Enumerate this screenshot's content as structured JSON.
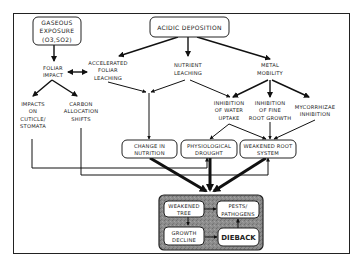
{
  "diagram": {
    "nodes": {
      "gaseous": [
        "GASEOUS",
        "EXPOSURE",
        "(O3,SO2)"
      ],
      "acidic": [
        "ACIDIC DEPOSITION"
      ],
      "foliar_impact": [
        "FOLIAR",
        "IMPACT"
      ],
      "accel_leaching": [
        "ACCELERATED",
        "FOLIAR",
        "LEACHING"
      ],
      "nutrient_leaching": [
        "NUTRIENT",
        "LEACHING"
      ],
      "metal_mobility": [
        "METAL",
        "MOBILITY"
      ],
      "impacts_cuticle": [
        "IMPACTS",
        "ON",
        "CUTICLE/",
        "STOMATA"
      ],
      "carbon_alloc": [
        "CARBON",
        "ALLOCATION",
        "SHIFTS"
      ],
      "inhib_water": [
        "INHIBITION",
        "OF WATER",
        "UPTAKE"
      ],
      "inhib_root": [
        "INHIBITION",
        "OF FINE",
        "ROOT GROWTH"
      ],
      "mycorrhizae": [
        "MYCORRHIZAE",
        "INHIBITION"
      ],
      "change_nutrition": [
        "CHANGE IN",
        "NUTRITION"
      ],
      "phys_drought": [
        "PHYSIOLOGICAL",
        "DROUGHT"
      ],
      "weak_root": [
        "WEAKENED ROOT",
        "SYSTEM"
      ],
      "weak_tree": [
        "WEAKENED",
        "TREE"
      ],
      "pests": [
        "PESTS/",
        "PATHOGENS"
      ],
      "growth_decline": [
        "GROWTH",
        "DECLINE"
      ],
      "dieback": [
        "DIEBACK"
      ]
    },
    "colors": {
      "ink": "#222222",
      "panel_fill": "#8a8a8a",
      "background": "#ffffff"
    }
  }
}
